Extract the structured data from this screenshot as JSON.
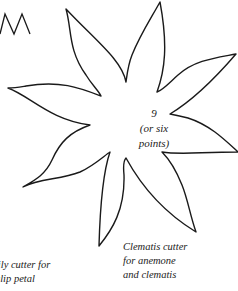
{
  "figure": {
    "partial_zigzag_shape": "zigzag-edge",
    "star_shape": {
      "points": 9,
      "stroke_color": "#1a1a1a"
    },
    "center_label": {
      "line1": "9",
      "line2": "(or six",
      "line3": "points)"
    },
    "clematis_caption": {
      "line1": "Clematis cutter",
      "line2": "for anemone",
      "line3": "and clematis"
    },
    "lily_caption": {
      "line1": "Lily cutter for",
      "line2": "tulip petal"
    }
  }
}
